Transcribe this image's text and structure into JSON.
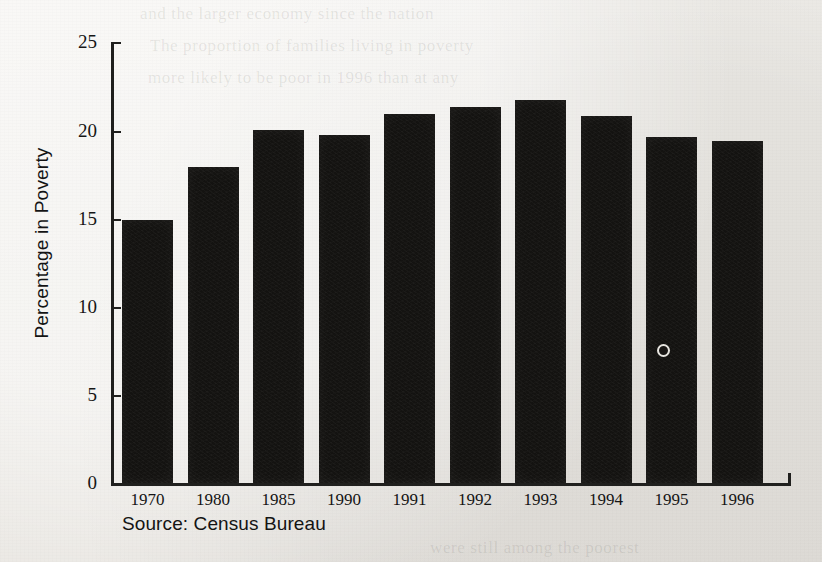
{
  "figure": {
    "source_note": "Source: Census Bureau",
    "background_color": "#edebe7",
    "bar_color": "#141311",
    "axis_color": "#20201e"
  },
  "chart_data": {
    "type": "bar",
    "title": "",
    "xlabel": "",
    "ylabel": "Percentage in Poverty",
    "categories": [
      "1970",
      "1980",
      "1985",
      "1990",
      "1991",
      "1992",
      "1993",
      "1994",
      "1995",
      "1996"
    ],
    "values": [
      14.9,
      17.9,
      20.0,
      19.7,
      20.9,
      21.3,
      21.7,
      20.8,
      19.6,
      19.4
    ],
    "ylim": [
      0,
      25
    ],
    "yticks": [
      0,
      5,
      10,
      15,
      20,
      25
    ],
    "ytick_labels": [
      "0",
      "5",
      "10",
      "15",
      "20",
      "25"
    ],
    "grid": false,
    "legend": null,
    "annotations": [
      "Source: Census Bureau"
    ]
  },
  "ghost_text": {
    "line1": "and the larger economy since the nation",
    "line2": "The proportion of families living in poverty",
    "line3": "more likely to be poor in 1996 than at any",
    "line4": "were still among the poorest"
  }
}
